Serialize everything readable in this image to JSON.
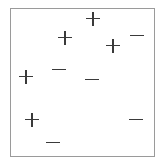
{
  "diagram": {
    "type": "labeled-point-scatter",
    "frame": {
      "left": 10,
      "top": 8,
      "right": 155,
      "bottom": 157,
      "border_color": "#9a9a9a"
    },
    "symbol_color": "#3a3a3a",
    "points": [
      {
        "label": "+",
        "class": "positive",
        "x": 93,
        "y": 19
      },
      {
        "label": "+",
        "class": "positive",
        "x": 65,
        "y": 38
      },
      {
        "label": "+",
        "class": "positive",
        "x": 113,
        "y": 46
      },
      {
        "label": "-",
        "class": "negative",
        "x": 137,
        "y": 36
      },
      {
        "label": "-",
        "class": "negative",
        "x": 59,
        "y": 70
      },
      {
        "label": "+",
        "class": "positive",
        "x": 26,
        "y": 77
      },
      {
        "label": "-",
        "class": "negative",
        "x": 92,
        "y": 80
      },
      {
        "label": "+",
        "class": "positive",
        "x": 32,
        "y": 120
      },
      {
        "label": "-",
        "class": "negative",
        "x": 136,
        "y": 120
      },
      {
        "label": "-",
        "class": "negative",
        "x": 53,
        "y": 143
      }
    ]
  }
}
